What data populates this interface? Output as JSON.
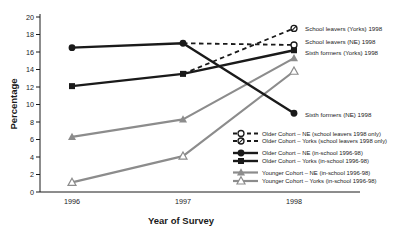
{
  "figure": {
    "background": "#ffffff",
    "ink_color": "#1a1a1a",
    "gray_color": "#8c8c8c"
  },
  "chart_data": {
    "type": "line",
    "title": "",
    "xlabel": "Year of Survey",
    "ylabel": "Percentage",
    "x_categories": [
      "1996",
      "1997",
      "1998"
    ],
    "ylim": [
      0,
      20
    ],
    "yticks": [
      0,
      2,
      4,
      6,
      8,
      10,
      12,
      14,
      16,
      18,
      20
    ],
    "grid": false,
    "legend_position": "inside-right",
    "series": [
      {
        "name": "Older Cohort – NE (in-school 1996-98)",
        "values": [
          16.5,
          17,
          9
        ],
        "color": "#1a1a1a",
        "style": "solid",
        "width": 2.4,
        "marker": "filled-circle"
      },
      {
        "name": "Older Cohort – Yorks (in-school 1996-98)",
        "values": [
          12.1,
          13.5,
          16.2
        ],
        "color": "#1a1a1a",
        "style": "solid",
        "width": 2.4,
        "marker": "filled-square"
      },
      {
        "name": "Older Cohort – NE (school leavers 1998 only)",
        "values": [
          null,
          17,
          16.8
        ],
        "color": "#1a1a1a",
        "style": "dashed",
        "width": 1.8,
        "marker": "open-circle",
        "marker_last_only": true
      },
      {
        "name": "Older Cohort – Yorks (school leavers 1998 only)",
        "values": [
          null,
          13.5,
          18.7
        ],
        "color": "#1a1a1a",
        "style": "dashed",
        "width": 1.8,
        "marker": "slashed-circle",
        "marker_last_only": true
      },
      {
        "name": "Younger Cohort – NE (in-school 1996-98)",
        "values": [
          6.3,
          8.3,
          15.3
        ],
        "color": "#8c8c8c",
        "style": "solid",
        "width": 2.2,
        "marker": "filled-triangle"
      },
      {
        "name": "Younger Cohort – Yorks (in-school 1996-98)",
        "values": [
          1.1,
          4.1,
          13.8
        ],
        "color": "#8c8c8c",
        "style": "solid",
        "width": 2.2,
        "marker": "open-triangle"
      }
    ],
    "legend_order": [
      2,
      3,
      0,
      1,
      4,
      5
    ],
    "annotations": [
      {
        "text": "School leavers (Yorks) 1998",
        "value": 18.7,
        "dx": 11,
        "dy": 2.5
      },
      {
        "text": "School leavers (NE) 1998",
        "value": 16.8,
        "dx": 11,
        "dy": -1
      },
      {
        "text": "Sixth formers (Yorks) 1998",
        "value": 16.2,
        "dx": 11,
        "dy": 5
      },
      {
        "text": "Sixth formers (NE) 1998",
        "value": 9,
        "dx": 11,
        "dy": 4
      }
    ]
  }
}
